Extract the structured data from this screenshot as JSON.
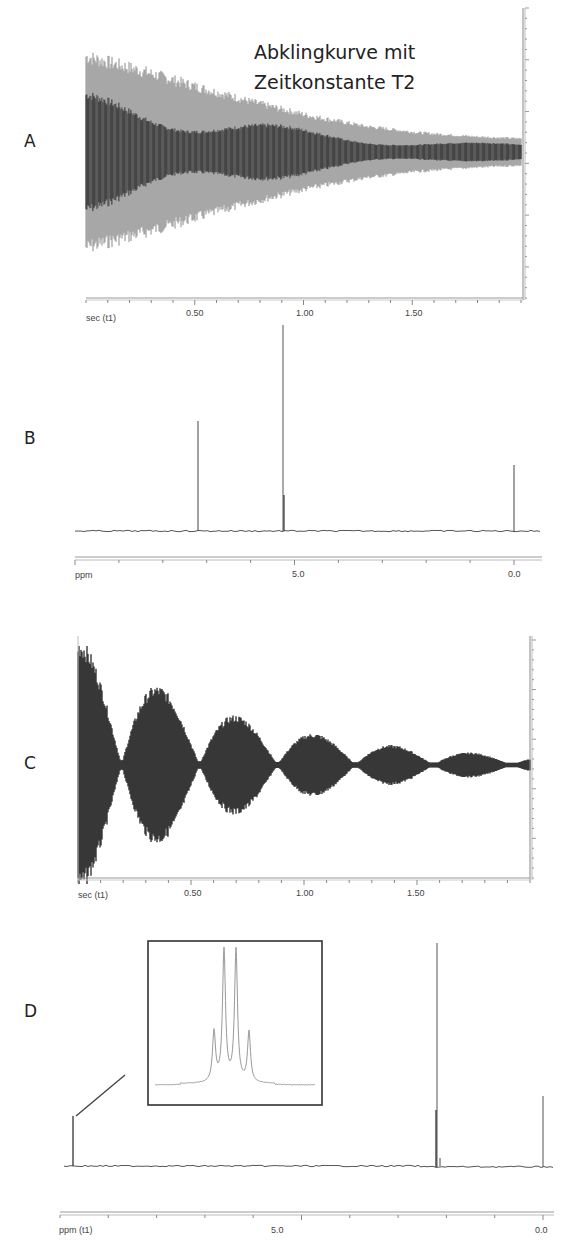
{
  "figure": {
    "panels": [
      {
        "id": "A",
        "label": "A",
        "title_line1": "Abklingkurve mit",
        "title_line2": "Zeitkonstante T2",
        "x_axis_label": "sec (t1)",
        "ticks": [
          "0.50",
          "1.00",
          "1.50"
        ]
      },
      {
        "id": "B",
        "label": "B",
        "x_axis_label": "ppm",
        "ticks": [
          "5.0",
          "0.0"
        ]
      },
      {
        "id": "C",
        "label": "C",
        "x_axis_label": "sec (t1)",
        "ticks": [
          "0.50",
          "1.00",
          "1.50"
        ]
      },
      {
        "id": "D",
        "label": "D",
        "x_axis_label": "ppm (t1)",
        "ticks": [
          "5.0",
          "0.0"
        ]
      }
    ]
  },
  "chart_data": [
    {
      "panel": "A",
      "type": "line",
      "title": "Abklingkurve mit Zeitkonstante T2",
      "xlabel": "sec (t1)",
      "ylabel": "",
      "xlim": [
        0.0,
        2.0
      ],
      "x_ticks": [
        0.5,
        1.0,
        1.5
      ],
      "description": "Free induction decay (FID) with exponential decay envelope, slight beating",
      "envelope": {
        "x": [
          0.0,
          0.25,
          0.5,
          0.75,
          1.0,
          1.25,
          1.5,
          1.75,
          1.95
        ],
        "amplitude": [
          1.0,
          0.85,
          0.68,
          0.52,
          0.38,
          0.27,
          0.2,
          0.16,
          0.14
        ]
      }
    },
    {
      "panel": "B",
      "type": "line",
      "title": "",
      "xlabel": "ppm",
      "xlim": [
        9.0,
        -0.5
      ],
      "x_ticks": [
        5.0,
        0.0
      ],
      "peaks": [
        {
          "ppm": 7.26,
          "relative_height": 0.53
        },
        {
          "ppm": 5.3,
          "relative_height": 1.0
        },
        {
          "ppm": 0.0,
          "relative_height": 0.32
        }
      ]
    },
    {
      "panel": "C",
      "type": "line",
      "title": "",
      "xlabel": "sec (t1)",
      "xlim": [
        0.0,
        2.0
      ],
      "x_ticks": [
        0.5,
        1.0,
        1.5
      ],
      "description": "FID with pronounced beat pattern (multiple lobes) and decaying envelope",
      "lobes": [
        {
          "center_sec": 0.02,
          "relative_amplitude": 1.0
        },
        {
          "center_sec": 0.33,
          "relative_amplitude": 0.82
        },
        {
          "center_sec": 0.68,
          "relative_amplitude": 0.58
        },
        {
          "center_sec": 1.02,
          "relative_amplitude": 0.33
        },
        {
          "center_sec": 1.37,
          "relative_amplitude": 0.18
        },
        {
          "center_sec": 1.72,
          "relative_amplitude": 0.08
        }
      ]
    },
    {
      "panel": "D",
      "type": "line",
      "title": "",
      "xlabel": "ppm (t1)",
      "xlim": [
        9.5,
        -0.2
      ],
      "x_ticks": [
        5.0,
        0.0
      ],
      "peaks": [
        {
          "ppm": 9.5,
          "relative_height": 0.22
        },
        {
          "ppm": 2.1,
          "relative_height": 1.0
        },
        {
          "ppm": 0.0,
          "relative_height": 0.32
        }
      ],
      "inset": {
        "description": "Expansion of peak at ~9.5 ppm showing a quartet",
        "multiplet_relative_heights": [
          0.38,
          1.0,
          1.0,
          0.38
        ]
      }
    }
  ]
}
